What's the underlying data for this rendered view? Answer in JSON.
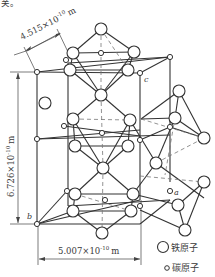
{
  "top_fragment": "关。",
  "dimensions": {
    "a_width": "4.515×10",
    "a_exp": "-10",
    "a_unit": "m",
    "height": "6.726×10",
    "height_exp": "-10",
    "height_unit": "m",
    "bottom_width": "5.007×10",
    "bottom_exp": "-10",
    "bottom_unit": "m"
  },
  "axis_labels": {
    "a": "a",
    "b": "b",
    "c": "c"
  },
  "legend": {
    "iron": "铁原子",
    "carbon": "碳原子"
  },
  "colors": {
    "line": "#333333",
    "dash": "#777777",
    "background": "#ffffff"
  }
}
